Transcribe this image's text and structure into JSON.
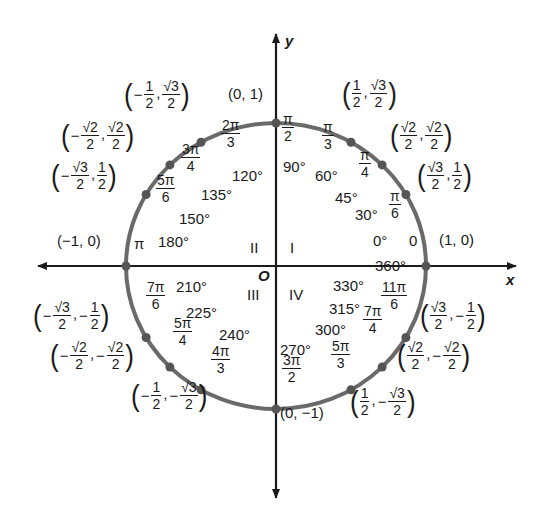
{
  "diagram": {
    "colors": {
      "axis": "#1a1a1a",
      "circle": "#6a6a6a",
      "point": "#555555",
      "text": "#1a1a1a"
    },
    "center": {
      "x": 276,
      "y": 266
    },
    "radius": {
      "x": 150,
      "y": 143
    },
    "x_axis": {
      "label": "x",
      "from": 38,
      "to": 516
    },
    "y_axis": {
      "label": "y",
      "from": 34,
      "to": 498
    },
    "origin_label": "O",
    "quadrants": [
      {
        "label": "I",
        "x": 290,
        "y": 240
      },
      {
        "label": "II",
        "x": 250,
        "y": 240
      },
      {
        "label": "III",
        "x": 247,
        "y": 287
      },
      {
        "label": "IV",
        "x": 289,
        "y": 287
      }
    ],
    "points": [
      {
        "deg": 0,
        "deg_label": "0°",
        "rad": {
          "plain": "0"
        },
        "coord": {
          "plain": "(1, 0)"
        },
        "deg_pos": [
          373,
          241
        ],
        "rad_pos": [
          409,
          241
        ],
        "coord_pos": [
          439,
          241
        ]
      },
      {
        "deg": 30,
        "deg_label": "30°",
        "rad": {
          "num": "π",
          "den": "6"
        },
        "coord": {
          "x": {
            "num": "√3",
            "den": "2"
          },
          "y": {
            "num": "1",
            "den": "2"
          }
        },
        "deg_pos": [
          355,
          215
        ],
        "rad_pos": [
          388,
          205
        ],
        "coord_pos": [
          417,
          178
        ]
      },
      {
        "deg": 45,
        "deg_label": "45°",
        "rad": {
          "num": "π",
          "den": "4"
        },
        "coord": {
          "x": {
            "num": "√2",
            "den": "2"
          },
          "y": {
            "num": "√2",
            "den": "2"
          }
        },
        "deg_pos": [
          335,
          198
        ],
        "rad_pos": [
          358,
          164
        ],
        "coord_pos": [
          390,
          138
        ]
      },
      {
        "deg": 60,
        "deg_label": "60°",
        "rad": {
          "num": "π",
          "den": "3"
        },
        "coord": {
          "x": {
            "num": "1",
            "den": "2"
          },
          "y": {
            "num": "√3",
            "den": "2"
          }
        },
        "deg_pos": [
          315,
          176
        ],
        "rad_pos": [
          321,
          136
        ],
        "coord_pos": [
          342,
          96
        ]
      },
      {
        "deg": 90,
        "deg_label": "90°",
        "rad": {
          "num": "π",
          "den": "2"
        },
        "coord": {
          "plain": "(0, 1)"
        },
        "deg_pos": [
          283,
          167
        ],
        "rad_pos": [
          281,
          128
        ],
        "coord_pos": [
          228,
          95
        ]
      },
      {
        "deg": 120,
        "deg_label": "120°",
        "rad": {
          "num": "2π",
          "den": "3"
        },
        "coord": {
          "x": {
            "num": "1",
            "den": "2",
            "neg": true
          },
          "y": {
            "num": "√3",
            "den": "2"
          }
        },
        "deg_pos": [
          232,
          176
        ],
        "rad_pos": [
          220,
          134
        ],
        "coord_pos": [
          124,
          97
        ]
      },
      {
        "deg": 135,
        "deg_label": "135°",
        "rad": {
          "num": "3π",
          "den": "4"
        },
        "coord": {
          "x": {
            "num": "√2",
            "den": "2",
            "neg": true
          },
          "y": {
            "num": "√2",
            "den": "2"
          }
        },
        "deg_pos": [
          201,
          195
        ],
        "rad_pos": [
          180,
          158
        ],
        "coord_pos": [
          61,
          138
        ]
      },
      {
        "deg": 150,
        "deg_label": "150°",
        "rad": {
          "num": "5π",
          "den": "6"
        },
        "coord": {
          "x": {
            "num": "√3",
            "den": "2",
            "neg": true
          },
          "y": {
            "num": "1",
            "den": "2"
          }
        },
        "deg_pos": [
          179,
          219
        ],
        "rad_pos": [
          155,
          189
        ],
        "coord_pos": [
          51,
          178
        ]
      },
      {
        "deg": 180,
        "deg_label": "180°",
        "rad": {
          "plain": "π"
        },
        "coord": {
          "plain": "(−1, 0)"
        },
        "deg_pos": [
          158,
          242
        ],
        "rad_pos": [
          134,
          244
        ],
        "coord_pos": [
          57,
          242
        ]
      },
      {
        "deg": 210,
        "deg_label": "210°",
        "rad": {
          "num": "7π",
          "den": "6"
        },
        "coord": {
          "x": {
            "num": "√3",
            "den": "2",
            "neg": true
          },
          "y": {
            "num": "1",
            "den": "2",
            "neg": true
          }
        },
        "deg_pos": [
          176,
          287
        ],
        "rad_pos": [
          145,
          296
        ],
        "coord_pos": [
          33,
          318
        ]
      },
      {
        "deg": 225,
        "deg_label": "225°",
        "rad": {
          "num": "5π",
          "den": "4"
        },
        "coord": {
          "x": {
            "num": "√2",
            "den": "2",
            "neg": true
          },
          "y": {
            "num": "√2",
            "den": "2",
            "neg": true
          }
        },
        "deg_pos": [
          186,
          313
        ],
        "rad_pos": [
          172,
          332
        ],
        "coord_pos": [
          50,
          358
        ]
      },
      {
        "deg": 240,
        "deg_label": "240°",
        "rad": {
          "num": "4π",
          "den": "3"
        },
        "coord": {
          "x": {
            "num": "1",
            "den": "2",
            "neg": true
          },
          "y": {
            "num": "√3",
            "den": "2",
            "neg": true
          }
        },
        "deg_pos": [
          219,
          335
        ],
        "rad_pos": [
          210,
          360
        ],
        "coord_pos": [
          131,
          398
        ]
      },
      {
        "deg": 270,
        "deg_label": "270°",
        "rad": {
          "num": "3π",
          "den": "2"
        },
        "coord": {
          "plain": "(0, −1)"
        },
        "deg_pos": [
          280,
          350
        ],
        "rad_pos": [
          281,
          369
        ],
        "coord_pos": [
          280,
          414
        ]
      },
      {
        "deg": 300,
        "deg_label": "300°",
        "rad": {
          "num": "5π",
          "den": "3"
        },
        "coord": {
          "x": {
            "num": "1",
            "den": "2"
          },
          "y": {
            "num": "√3",
            "den": "2",
            "neg": true
          }
        },
        "deg_pos": [
          315,
          330
        ],
        "rad_pos": [
          330,
          355
        ],
        "coord_pos": [
          350,
          404
        ]
      },
      {
        "deg": 315,
        "deg_label": "315°",
        "rad": {
          "num": "7π",
          "den": "4"
        },
        "coord": {
          "x": {
            "num": "√2",
            "den": "2"
          },
          "y": {
            "num": "√2",
            "den": "2",
            "neg": true
          }
        },
        "deg_pos": [
          329,
          309
        ],
        "rad_pos": [
          362,
          320
        ],
        "coord_pos": [
          397,
          358
        ]
      },
      {
        "deg": 330,
        "deg_label": "330°",
        "rad": {
          "num": "11π",
          "den": "6"
        },
        "coord": {
          "x": {
            "num": "√3",
            "den": "2"
          },
          "y": {
            "num": "1",
            "den": "2",
            "neg": true
          }
        },
        "deg_pos": [
          333,
          286
        ],
        "rad_pos": [
          380,
          296
        ],
        "coord_pos": [
          420,
          318
        ]
      },
      {
        "deg": 360,
        "deg_label": "360°",
        "rad": null,
        "coord": null,
        "deg_pos": [
          375,
          266
        ],
        "rad_pos": null,
        "coord_pos": null
      }
    ]
  }
}
